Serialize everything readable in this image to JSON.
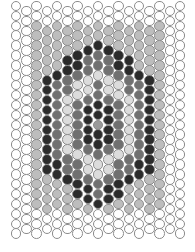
{
  "pattern": {
    "type": "peyote-bead-pattern",
    "columns": 17,
    "rows": 24,
    "origin_x": 16,
    "origin_y": 6,
    "col_pitch": 10.25,
    "row_pitch": 9.9,
    "odd_col_offset": 5,
    "bead_size": 10.5,
    "center": {
      "col": 8,
      "x": 98,
      "y": 124
    },
    "border_columns": [
      0,
      1,
      15,
      16
    ],
    "border_rows_top": 2,
    "border_rows_bottom": 4,
    "colors": {
      "white": "#ffffff",
      "light": "#bdbdbd",
      "pale": "#dcdcdc",
      "mid": "#707070",
      "dark": "#2b2b2b",
      "center": "#9a9a9a",
      "outline": "#8c8c8c"
    },
    "rings": [
      "center",
      "dark",
      "mid",
      "pale",
      "mid",
      "dark",
      "light"
    ],
    "ring_width": 1.0
  }
}
